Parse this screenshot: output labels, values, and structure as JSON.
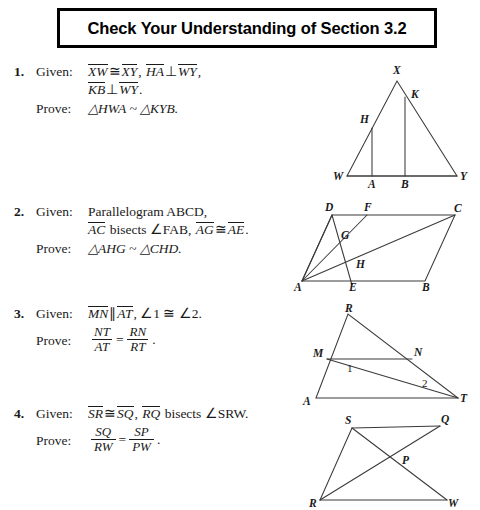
{
  "title": {
    "text": "Check Your Understanding of Section 3.2"
  },
  "labels": {
    "given": "Given:",
    "prove": "Prove:"
  },
  "problems": [
    {
      "number": "1.",
      "given_line1_a": "XW",
      "given_line1_cong": "≅",
      "given_line1_b": "XY",
      "given_line1_comma": ",",
      "given_line1_c": "HA",
      "given_line1_perp": "⊥",
      "given_line1_d": "WY",
      "given_line1_end": ",",
      "given_line2_a": "KB",
      "given_line2_perp": "⊥",
      "given_line2_b": "WY",
      "given_line2_end": ".",
      "prove_text": "△HWA ~ △KYB.",
      "diagram": {
        "name": "triangle-wxy-with-altitudes",
        "vertices": [
          "W",
          "X",
          "Y",
          "H",
          "K",
          "A",
          "B"
        ]
      }
    },
    {
      "number": "2.",
      "given_line1": "Parallelogram ABCD,",
      "given_line2_a": "AC",
      "given_line2_mid": " bisects ∠FAB, ",
      "given_line2_b": "AG",
      "given_line2_cong": "≅",
      "given_line2_c": "AE",
      "given_line2_end": ".",
      "prove_text": "△AHG ~ △CHD.",
      "diagram": {
        "name": "parallelogram-abcd",
        "vertices": [
          "A",
          "B",
          "C",
          "D",
          "E",
          "F",
          "G",
          "H"
        ]
      }
    },
    {
      "number": "3.",
      "given_line1_a": "MN",
      "given_line1_par": "∥",
      "given_line1_b": "AT",
      "given_line1_end": ", ∠1 ≅ ∠2.",
      "prove_frac_left_num": "NT",
      "prove_frac_left_den": "AT",
      "prove_equals": "=",
      "prove_frac_right_num": "RN",
      "prove_frac_right_den": "RT",
      "prove_period": ".",
      "diagram": {
        "name": "triangle-art-with-mn",
        "vertices": [
          "A",
          "R",
          "T",
          "M",
          "N"
        ],
        "angle_labels": [
          "1",
          "2"
        ]
      }
    },
    {
      "number": "4.",
      "given_line1_a": "SR",
      "given_line1_cong": "≅",
      "given_line1_b": "SQ",
      "given_line1_comma": ", ",
      "given_line1_c": "RQ",
      "given_line1_end": " bisects ∠SRW.",
      "prove_frac_left_num": "SQ",
      "prove_frac_left_den": "RW",
      "prove_equals": "=",
      "prove_frac_right_num": "SP",
      "prove_frac_right_den": "PW",
      "prove_period": ".",
      "diagram": {
        "name": "quadrilateral-sqwr-diagonals",
        "vertices": [
          "S",
          "Q",
          "R",
          "W",
          "P"
        ]
      }
    }
  ],
  "colors": {
    "ink": "#1a1a1a",
    "line": "#3a3a3a",
    "border": "#000000",
    "background": "#ffffff"
  }
}
